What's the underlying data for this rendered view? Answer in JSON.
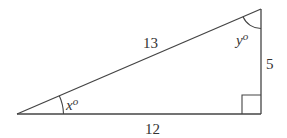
{
  "diagram": {
    "type": "right-triangle",
    "stroke_color": "#444444",
    "text_color": "#333333",
    "vertices": {
      "bottom_left": [
        17,
        114
      ],
      "top_right": [
        261,
        9
      ],
      "bottom_right": [
        261,
        114
      ]
    },
    "sides": {
      "hypotenuse": "13",
      "vertical": "5",
      "horizontal": "12"
    },
    "angles": {
      "bottom_left": {
        "var": "x",
        "unit": "o"
      },
      "top_right": {
        "var": "y",
        "unit": "o"
      },
      "bottom_right": {
        "marker": "right-angle"
      }
    }
  }
}
